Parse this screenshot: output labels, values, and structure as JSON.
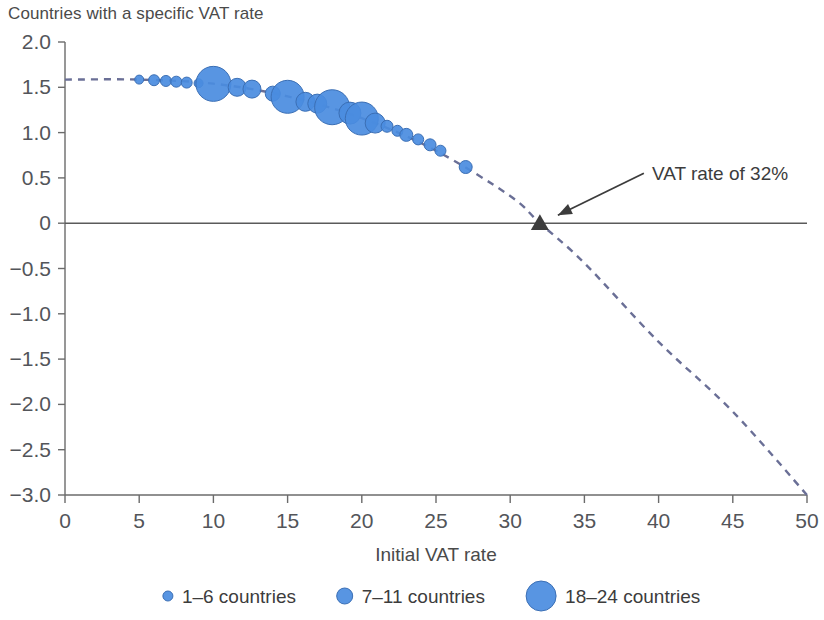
{
  "chart_data": {
    "type": "scatter",
    "title": "Countries with a specific VAT rate",
    "xlabel": "Initial VAT rate",
    "ylabel": "",
    "xlim": [
      0,
      50
    ],
    "ylim": [
      -3.0,
      2.0
    ],
    "grid": false,
    "x_ticks": [
      "0",
      "5",
      "10",
      "15",
      "20",
      "25",
      "30",
      "35",
      "40",
      "45",
      "50"
    ],
    "x_tick_values": [
      0,
      5,
      10,
      15,
      20,
      25,
      30,
      35,
      40,
      45,
      50
    ],
    "y_ticks": [
      "2.0",
      "1.5",
      "1.0",
      "0.5",
      "0",
      "-0.5",
      "-1.0",
      "-1.5",
      "-2.0",
      "-2.5",
      "-3.0"
    ],
    "y_tick_values": [
      2.0,
      1.5,
      1.0,
      0.5,
      0,
      -0.5,
      -1.0,
      -1.5,
      -2.0,
      -2.5,
      -3.0
    ],
    "series": [
      {
        "name": "Countries with a specific VAT rate",
        "marker": "bubble",
        "color": "#4a8ce0",
        "edge_color": "#3b6fb5",
        "points": [
          {
            "x": 5.0,
            "y": 1.585,
            "countries": 2,
            "r": 4.5
          },
          {
            "x": 6.0,
            "y": 1.578,
            "countries": 3,
            "r": 5.5
          },
          {
            "x": 6.8,
            "y": 1.57,
            "countries": 3,
            "r": 5.5
          },
          {
            "x": 7.5,
            "y": 1.562,
            "countries": 3,
            "r": 5.5
          },
          {
            "x": 8.2,
            "y": 1.552,
            "countries": 3,
            "r": 5.5
          },
          {
            "x": 9.0,
            "y": 1.545,
            "countries": 2,
            "r": 4.5
          },
          {
            "x": 10.0,
            "y": 1.538,
            "countries": 22,
            "r": 17.5
          },
          {
            "x": 11.6,
            "y": 1.5,
            "countries": 7,
            "r": 9.0
          },
          {
            "x": 12.6,
            "y": 1.48,
            "countries": 7,
            "r": 9.0
          },
          {
            "x": 14.0,
            "y": 1.43,
            "countries": 6,
            "r": 7.5
          },
          {
            "x": 15.0,
            "y": 1.395,
            "countries": 20,
            "r": 16.5
          },
          {
            "x": 16.2,
            "y": 1.34,
            "countries": 8,
            "r": 9.5
          },
          {
            "x": 17.0,
            "y": 1.32,
            "countries": 8,
            "r": 9.5
          },
          {
            "x": 18.0,
            "y": 1.28,
            "countries": 22,
            "r": 17.5
          },
          {
            "x": 19.2,
            "y": 1.215,
            "countries": 10,
            "r": 11.0
          },
          {
            "x": 20.0,
            "y": 1.155,
            "countries": 20,
            "r": 16.5
          },
          {
            "x": 20.9,
            "y": 1.105,
            "countries": 9,
            "r": 10.0
          },
          {
            "x": 21.7,
            "y": 1.07,
            "countries": 4,
            "r": 6.0
          },
          {
            "x": 22.4,
            "y": 1.02,
            "countries": 3,
            "r": 5.5
          },
          {
            "x": 23.0,
            "y": 0.975,
            "countries": 4,
            "r": 6.5
          },
          {
            "x": 23.8,
            "y": 0.925,
            "countries": 3,
            "r": 5.5
          },
          {
            "x": 24.6,
            "y": 0.865,
            "countries": 4,
            "r": 6.0
          },
          {
            "x": 25.3,
            "y": 0.8,
            "countries": 3,
            "r": 5.5
          },
          {
            "x": 27.0,
            "y": 0.62,
            "countries": 4,
            "r": 6.5
          }
        ]
      }
    ],
    "trend_curve": {
      "name": "fitted trend",
      "style": "dashed",
      "color": "#6a6f96",
      "x_start": 0,
      "x_end": 50,
      "zero_crossing_x": 32,
      "points": [
        {
          "x": 0,
          "y": 1.585
        },
        {
          "x": 5,
          "y": 1.585
        },
        {
          "x": 10,
          "y": 1.54
        },
        {
          "x": 15,
          "y": 1.4
        },
        {
          "x": 20,
          "y": 1.16
        },
        {
          "x": 25,
          "y": 0.8
        },
        {
          "x": 30,
          "y": 0.3
        },
        {
          "x": 32,
          "y": 0.0
        },
        {
          "x": 35,
          "y": -0.44
        },
        {
          "x": 40,
          "y": -1.31
        },
        {
          "x": 45,
          "y": -2.08
        },
        {
          "x": 50,
          "y": -3.0
        }
      ]
    },
    "markers": [
      {
        "name": "zero-crossing-marker",
        "shape": "triangle",
        "color": "#3d3d3d",
        "x": 32,
        "y": 0
      }
    ],
    "annotations": [
      {
        "name": "vat-rate-annotation",
        "text": "VAT rate of 32%",
        "target_x": 32,
        "target_y": 0,
        "color": "#3c3c3c"
      }
    ],
    "zero_line": {
      "y": 0,
      "color": "#5a5a5a"
    },
    "legend": {
      "position": "bottom",
      "entries": [
        {
          "label": "1-6 countries",
          "radius": 5.0,
          "color": "#4a8ce0"
        },
        {
          "label": "7-11 countries",
          "radius": 8.0,
          "color": "#4a8ce0"
        },
        {
          "label": "18-24 countries",
          "radius": 15.0,
          "color": "#4a8ce0"
        }
      ]
    }
  }
}
